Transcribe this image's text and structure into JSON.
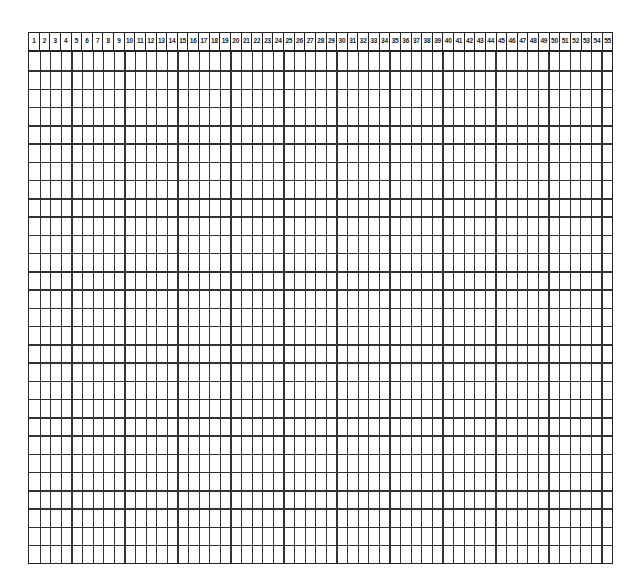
{
  "sheet": {
    "type": "blank numbered grid paper",
    "column_count": 55,
    "row_count": 28,
    "line_color": "#222222",
    "background_color": "#ffffff",
    "header": {
      "columns": [
        "1",
        "2",
        "3",
        "4",
        "5",
        "6",
        "7",
        "8",
        "9",
        "10",
        "11",
        "12",
        "13",
        "14",
        "15",
        "16",
        "17",
        "18",
        "19",
        "20",
        "21",
        "22",
        "23",
        "24",
        "25",
        "26",
        "27",
        "28",
        "29",
        "30",
        "31",
        "32",
        "33",
        "34",
        "35",
        "36",
        "37",
        "38",
        "39",
        "40",
        "41",
        "42",
        "43",
        "44",
        "45",
        "46",
        "47",
        "48",
        "49",
        "50",
        "51",
        "52",
        "53",
        "54",
        "55"
      ]
    }
  }
}
